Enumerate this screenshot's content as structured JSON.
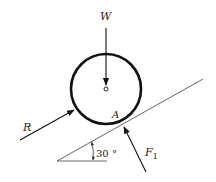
{
  "diagram": {
    "type": "free-body diagram",
    "labels": {
      "weight": "W",
      "reaction": "R",
      "contact_point": "A",
      "force_main": "F",
      "force_sub": "1",
      "angle": "30 °"
    },
    "colors": {
      "stroke": "#111111",
      "incline": "#555555",
      "background": "#ffffff"
    },
    "geometry": {
      "circle_center": [
        106,
        89
      ],
      "circle_radius": 35,
      "incline_angle_deg": 30
    }
  }
}
